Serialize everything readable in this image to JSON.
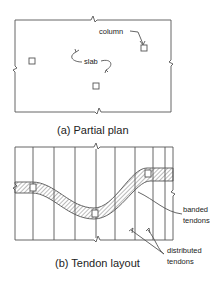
{
  "figure": {
    "partial_plan": {
      "caption": "(a) Partial plan",
      "labels": {
        "column": "column",
        "slab": "slab"
      },
      "columns_count": 3
    },
    "tendon_layout": {
      "caption": "(b) Tendon layout",
      "labels": {
        "banded_line1": "banded",
        "banded_line2": "tendons",
        "distributed_line1": "distributed",
        "distributed_line2": "tendons"
      },
      "distributed_tendon_lines": 8,
      "columns_count": 3
    },
    "colors": {
      "line": "#555555",
      "text": "#222222",
      "background": "#ffffff"
    }
  }
}
